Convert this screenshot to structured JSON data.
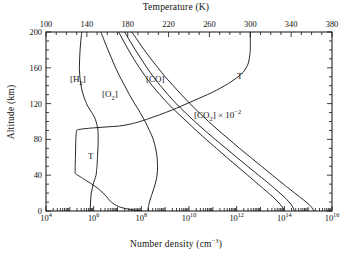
{
  "chart_data": {
    "type": "line",
    "title": "",
    "xlabel": "Number density (cm−3)",
    "xlabel_top": "Temperature (K)",
    "ylabel": "Altitude (km)",
    "xscale": "log",
    "xlim": [
      10000,
      1e+16
    ],
    "ylim": [
      0,
      200
    ],
    "xlim_top": [
      100,
      380
    ],
    "grid": false,
    "legend": "inline-annotations",
    "bottom_ticks": [
      "10⁴",
      "10⁶",
      "10⁸",
      "10¹⁰",
      "10¹²",
      "10¹⁴",
      "10¹⁶"
    ],
    "bottom_tick_values": [
      4,
      6,
      8,
      10,
      12,
      14,
      16
    ],
    "top_ticks": [
      "100",
      "140",
      "180",
      "220",
      "260",
      "300",
      "340",
      "380"
    ],
    "top_tick_values": [
      100,
      140,
      180,
      220,
      260,
      300,
      340,
      380
    ],
    "left_ticks": [
      "0",
      "40",
      "80",
      "120",
      "160",
      "200"
    ],
    "left_tick_values": [
      0,
      40,
      80,
      120,
      160,
      200
    ],
    "annotations": [
      {
        "name": "h2-label",
        "text_html": "[H<sub>2</sub>]",
        "x_px": 70,
        "y_px": 74
      },
      {
        "name": "o2-label",
        "text_html": "[O<sub>2</sub>]",
        "x_px": 102,
        "y_px": 89
      },
      {
        "name": "co-label",
        "text_html": "[CO]",
        "x_px": 146,
        "y_px": 74
      },
      {
        "name": "co2-label",
        "text_html": "[CO<sub>2</sub>] × 10<sup>−2</sup>",
        "x_px": 194,
        "y_px": 110
      },
      {
        "name": "temperature-label-upper",
        "text_html": "T",
        "x_px": 237,
        "y_px": 71
      },
      {
        "name": "temperature-label-lower",
        "text_html": "T",
        "x_px": 88,
        "y_px": 151
      }
    ],
    "series": [
      {
        "name": "[H2]",
        "label": "[H₂]",
        "axis": "bottom-log",
        "points": [
          [
            200,
            5.5
          ],
          [
            190,
            5.46
          ],
          [
            180,
            5.43
          ],
          [
            170,
            5.41
          ],
          [
            160,
            5.4
          ],
          [
            150,
            5.42
          ],
          [
            140,
            5.47
          ],
          [
            130,
            5.56
          ],
          [
            120,
            5.7
          ],
          [
            115,
            5.8
          ],
          [
            110,
            5.92
          ],
          [
            105,
            6.03
          ],
          [
            100,
            6.1
          ],
          [
            95,
            6.15
          ],
          [
            90,
            6.18
          ],
          [
            80,
            6.19
          ],
          [
            70,
            6.18
          ],
          [
            60,
            6.16
          ],
          [
            50,
            6.14
          ],
          [
            45,
            6.12
          ],
          [
            40,
            6.1
          ],
          [
            35,
            6.04
          ],
          [
            30,
            5.98
          ],
          [
            25,
            5.94
          ],
          [
            20,
            5.9
          ],
          [
            15,
            5.88
          ],
          [
            10,
            5.87
          ],
          [
            5,
            5.86
          ],
          [
            0,
            5.86
          ]
        ]
      },
      {
        "name": "[O2]",
        "label": "[O₂]",
        "axis": "bottom-log",
        "points": [
          [
            200,
            6.3
          ],
          [
            190,
            6.45
          ],
          [
            180,
            6.6
          ],
          [
            170,
            6.76
          ],
          [
            160,
            6.92
          ],
          [
            150,
            7.1
          ],
          [
            140,
            7.3
          ],
          [
            130,
            7.5
          ],
          [
            120,
            7.72
          ],
          [
            110,
            7.95
          ],
          [
            100,
            8.16
          ],
          [
            90,
            8.34
          ],
          [
            80,
            8.5
          ],
          [
            70,
            8.6
          ],
          [
            60,
            8.66
          ],
          [
            50,
            8.68
          ],
          [
            40,
            8.66
          ],
          [
            30,
            8.58
          ],
          [
            20,
            8.46
          ],
          [
            10,
            8.34
          ],
          [
            5,
            8.3
          ],
          [
            0,
            8.27
          ]
        ]
      },
      {
        "name": "[CO]",
        "label": "[CO]",
        "axis": "bottom-log",
        "points": [
          [
            200,
            7.05
          ],
          [
            190,
            7.25
          ],
          [
            180,
            7.46
          ],
          [
            170,
            7.68
          ],
          [
            160,
            7.92
          ],
          [
            150,
            8.18
          ],
          [
            140,
            8.46
          ],
          [
            130,
            8.78
          ],
          [
            120,
            9.12
          ],
          [
            110,
            9.5
          ],
          [
            100,
            9.9
          ],
          [
            90,
            10.3
          ],
          [
            80,
            10.72
          ],
          [
            70,
            11.15
          ],
          [
            60,
            11.58
          ],
          [
            50,
            12.02
          ],
          [
            40,
            12.46
          ],
          [
            30,
            12.9
          ],
          [
            25,
            13.12
          ],
          [
            20,
            13.34
          ],
          [
            15,
            13.55
          ],
          [
            10,
            13.74
          ],
          [
            5,
            13.9
          ],
          [
            0,
            14.0
          ]
        ]
      },
      {
        "name": "[CO2]x10^-2",
        "label": "[CO₂] × 10⁻²",
        "axis": "bottom-log",
        "points": [
          [
            200,
            7.3
          ],
          [
            190,
            7.52
          ],
          [
            180,
            7.75
          ],
          [
            170,
            7.99
          ],
          [
            160,
            8.24
          ],
          [
            150,
            8.5
          ],
          [
            140,
            8.8
          ],
          [
            130,
            9.12
          ],
          [
            120,
            9.46
          ],
          [
            110,
            9.84
          ],
          [
            100,
            10.24
          ],
          [
            90,
            10.66
          ],
          [
            80,
            11.1
          ],
          [
            70,
            11.55
          ],
          [
            60,
            12.0
          ],
          [
            50,
            12.46
          ],
          [
            40,
            12.92
          ],
          [
            30,
            13.38
          ],
          [
            25,
            13.6
          ],
          [
            20,
            13.82
          ],
          [
            15,
            14.02
          ],
          [
            10,
            14.2
          ],
          [
            5,
            14.34
          ],
          [
            0,
            14.42
          ]
        ]
      },
      {
        "name": "[CO2]",
        "label": "[CO₂]",
        "axis": "bottom-log",
        "points": [
          [
            200,
            7.6
          ],
          [
            190,
            7.86
          ],
          [
            180,
            8.12
          ],
          [
            170,
            8.4
          ],
          [
            160,
            8.7
          ],
          [
            150,
            9.0
          ],
          [
            140,
            9.34
          ],
          [
            130,
            9.68
          ],
          [
            120,
            10.04
          ],
          [
            110,
            10.42
          ],
          [
            100,
            10.82
          ],
          [
            90,
            11.24
          ],
          [
            80,
            11.68
          ],
          [
            70,
            12.12
          ],
          [
            60,
            12.58
          ],
          [
            50,
            13.04
          ],
          [
            40,
            13.5
          ],
          [
            30,
            13.96
          ],
          [
            25,
            14.2
          ],
          [
            20,
            14.44
          ],
          [
            15,
            14.68
          ],
          [
            10,
            14.92
          ],
          [
            5,
            15.12
          ],
          [
            0,
            15.24
          ]
        ]
      },
      {
        "name": "T",
        "label": "T",
        "axis": "top-temperature",
        "points": [
          [
            200,
            300
          ],
          [
            190,
            300
          ],
          [
            180,
            300
          ],
          [
            175,
            299.6
          ],
          [
            170,
            299
          ],
          [
            165,
            298
          ],
          [
            160,
            296
          ],
          [
            155,
            293
          ],
          [
            150,
            288
          ],
          [
            145,
            282
          ],
          [
            140,
            275
          ],
          [
            135,
            267
          ],
          [
            130,
            258
          ],
          [
            125,
            248
          ],
          [
            120,
            238
          ],
          [
            115,
            228
          ],
          [
            110,
            217
          ],
          [
            105,
            205
          ],
          [
            100,
            192
          ],
          [
            97,
            182
          ],
          [
            95,
            172
          ],
          [
            94,
            160
          ],
          [
            93,
            148
          ],
          [
            92,
            138
          ],
          [
            91,
            132
          ],
          [
            90,
            130
          ],
          [
            85,
            129.5
          ],
          [
            80,
            129.2
          ],
          [
            70,
            129
          ],
          [
            60,
            128.8
          ],
          [
            50,
            128.6
          ],
          [
            45,
            128.5
          ],
          [
            42,
            128.6
          ],
          [
            41,
            129.5
          ],
          [
            40,
            131
          ],
          [
            38,
            134
          ],
          [
            35,
            138
          ],
          [
            30,
            145
          ],
          [
            25,
            151
          ],
          [
            20,
            156
          ],
          [
            15,
            160
          ],
          [
            10,
            164
          ],
          [
            5,
            171
          ],
          [
            2,
            181
          ],
          [
            0,
            194
          ]
        ]
      }
    ]
  },
  "geometry": {
    "plot_left_px": 46,
    "plot_right_px": 332,
    "plot_top_px": 32,
    "plot_bottom_px": 211
  }
}
